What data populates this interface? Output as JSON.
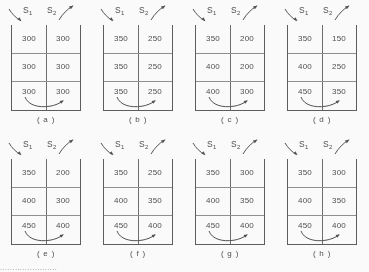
{
  "figure": {
    "column_labels": {
      "s1": "S",
      "s1_sub": "1",
      "s2": "S",
      "s2_sub": "2"
    },
    "icons": {
      "inflow_arrow": "curved-arrow-down-right",
      "outflow_arrow": "curved-arrow-up-right",
      "transfer_arrow": "curved-arrow-left-to-right"
    },
    "bottom_edge_text": "......................."
  },
  "chart_data": {
    "type": "table",
    "title": "",
    "xlabel": "",
    "ylabel": "",
    "columns": [
      "S1",
      "S2"
    ],
    "rows": 3,
    "panels": [
      {
        "caption": "( a )",
        "letter": "a",
        "cells": [
          [
            "300",
            "300"
          ],
          [
            "300",
            "300"
          ],
          [
            "300",
            "300"
          ]
        ]
      },
      {
        "caption": "( b )",
        "letter": "b",
        "cells": [
          [
            "350",
            "250"
          ],
          [
            "350",
            "250"
          ],
          [
            "350",
            "250"
          ]
        ]
      },
      {
        "caption": "( c )",
        "letter": "c",
        "cells": [
          [
            "350",
            "200"
          ],
          [
            "400",
            "200"
          ],
          [
            "400",
            "300"
          ]
        ]
      },
      {
        "caption": "( d )",
        "letter": "d",
        "cells": [
          [
            "350",
            "150"
          ],
          [
            "400",
            "250"
          ],
          [
            "450",
            "350"
          ]
        ]
      },
      {
        "caption": "( e )",
        "letter": "e",
        "cells": [
          [
            "350",
            "200"
          ],
          [
            "400",
            "300"
          ],
          [
            "450",
            "400"
          ]
        ]
      },
      {
        "caption": "( f )",
        "letter": "f",
        "cells": [
          [
            "350",
            "250"
          ],
          [
            "400",
            "350"
          ],
          [
            "450",
            "400"
          ]
        ]
      },
      {
        "caption": "( g )",
        "letter": "g",
        "cells": [
          [
            "350",
            "300"
          ],
          [
            "400",
            "350"
          ],
          [
            "450",
            "400"
          ]
        ]
      },
      {
        "caption": "( h )",
        "letter": "h",
        "cells": [
          [
            "350",
            "300"
          ],
          [
            "400",
            "350"
          ],
          [
            "450",
            "400"
          ]
        ]
      }
    ]
  }
}
